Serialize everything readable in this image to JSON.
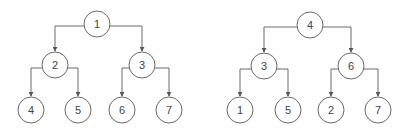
{
  "colors": {
    "stroke": "#6b6b6b",
    "text": "#444444",
    "background": "#ffffff"
  },
  "node_radius": 13,
  "trees": [
    {
      "name": "left-tree",
      "nodes": [
        {
          "id": "a",
          "label": "1",
          "x": 97,
          "y": 24
        },
        {
          "id": "b",
          "label": "2",
          "x": 55,
          "y": 65
        },
        {
          "id": "c",
          "label": "3",
          "x": 142,
          "y": 65
        },
        {
          "id": "d",
          "label": "4",
          "x": 31,
          "y": 110
        },
        {
          "id": "e",
          "label": "5",
          "x": 78,
          "y": 110
        },
        {
          "id": "f",
          "label": "6",
          "x": 122,
          "y": 110
        },
        {
          "id": "g",
          "label": "7",
          "x": 169,
          "y": 110
        }
      ],
      "edges": [
        [
          "a",
          "b"
        ],
        [
          "a",
          "c"
        ],
        [
          "b",
          "d"
        ],
        [
          "b",
          "e"
        ],
        [
          "c",
          "f"
        ],
        [
          "c",
          "g"
        ]
      ]
    },
    {
      "name": "right-tree",
      "nodes": [
        {
          "id": "a",
          "label": "4",
          "x": 310,
          "y": 25
        },
        {
          "id": "b",
          "label": "3",
          "x": 264,
          "y": 66
        },
        {
          "id": "c",
          "label": "6",
          "x": 351,
          "y": 66
        },
        {
          "id": "d",
          "label": "1",
          "x": 240,
          "y": 110
        },
        {
          "id": "e",
          "label": "5",
          "x": 288,
          "y": 110
        },
        {
          "id": "f",
          "label": "2",
          "x": 331,
          "y": 110
        },
        {
          "id": "g",
          "label": "7",
          "x": 378,
          "y": 110
        }
      ],
      "edges": [
        [
          "a",
          "b"
        ],
        [
          "a",
          "c"
        ],
        [
          "b",
          "d"
        ],
        [
          "b",
          "e"
        ],
        [
          "c",
          "f"
        ],
        [
          "c",
          "g"
        ]
      ]
    }
  ]
}
